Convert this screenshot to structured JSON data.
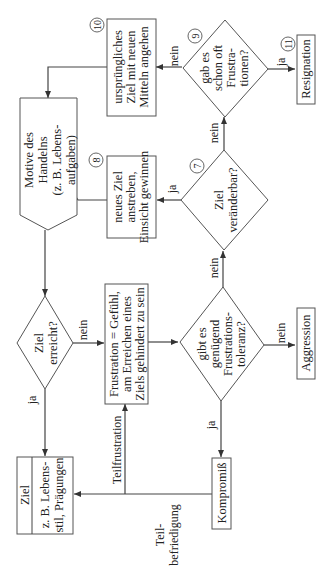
{
  "diagram": {
    "orientation": "rotated-90-ccw",
    "nodes": {
      "motive": {
        "lines": [
          "Motive des",
          "Handelns",
          "(z. B. Lebens-",
          "aufgaben)"
        ]
      },
      "ziel_erreicht": {
        "lines": [
          "Ziel",
          "erreicht?"
        ]
      },
      "ziel_box": {
        "title": "Ziel",
        "lines": [
          "z. B. Lebens-",
          "stil, Prägungen"
        ]
      },
      "frustration": {
        "lines": [
          "Frustration = Gefühl,",
          "am Erreichen eines",
          "Ziels gehindert zu sein"
        ]
      },
      "toleranz": {
        "lines": [
          "gibt es",
          "genügend",
          "Frustrations-",
          "toleranz?"
        ]
      },
      "kompromiss": {
        "label": "Kompromiß"
      },
      "aggression": {
        "label": "Aggression"
      },
      "veraenderbar": {
        "lines": [
          "Ziel",
          "veränderbar?"
        ],
        "number": "7"
      },
      "neues_ziel": {
        "lines": [
          "neues Ziel",
          "anstreben,",
          "Einsicht gewinnen"
        ],
        "number": "8"
      },
      "oft_frustrationen": {
        "lines": [
          "gab es",
          "schon oft",
          "Frustra-",
          "tionen?"
        ],
        "number": "9"
      },
      "urspruengliches": {
        "lines": [
          "ursprüngliches",
          "Ziel mit neuen",
          "Mitteln angehen"
        ],
        "number": "10"
      },
      "resignation": {
        "label": "Resignation",
        "number": "11"
      }
    },
    "edge_labels": {
      "ja": "ja",
      "nein": "nein",
      "teilfrustration": "Teilfrustration",
      "teilbefriedigung": [
        "Teil-",
        "befriedigung"
      ]
    }
  }
}
